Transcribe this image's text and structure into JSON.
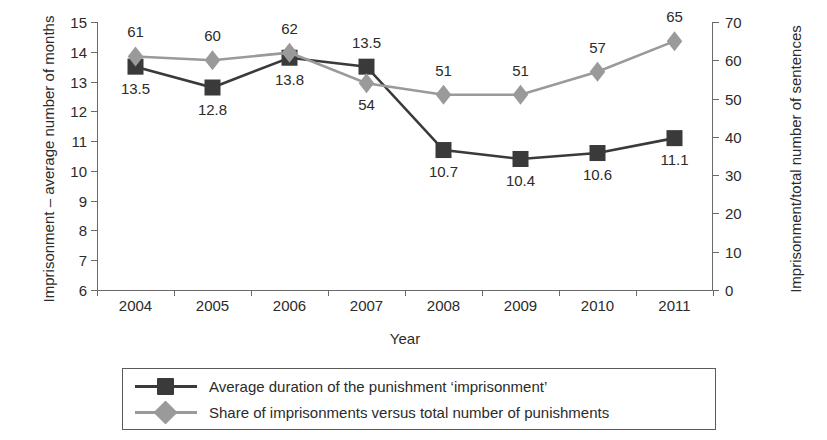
{
  "chart_data": {
    "type": "line",
    "title": "",
    "xlabel": "Year",
    "ylabel": "Imprisonment – average number of months",
    "ylabel_right": "Imprisonment/total number of sentences",
    "categories": [
      "2004",
      "2005",
      "2006",
      "2007",
      "2008",
      "2009",
      "2010",
      "2011"
    ],
    "ylim": [
      6,
      15
    ],
    "ylim_right": [
      0,
      70
    ],
    "ytick_step": 1,
    "ytick_right_step": 10,
    "yticks": [
      "15",
      "14",
      "13",
      "12",
      "11",
      "10",
      "9",
      "8",
      "7",
      "6"
    ],
    "yticks_right": [
      "70",
      "60",
      "50",
      "40",
      "30",
      "20",
      "10",
      "0"
    ],
    "grid": false,
    "legend_position": "bottom",
    "series": [
      {
        "name": "Average duration of the punishment ‘imprisonment’",
        "axis": "left",
        "marker": "square",
        "color": "#3a3a3a",
        "values": [
          13.5,
          12.8,
          13.8,
          13.5,
          10.7,
          10.4,
          10.6,
          11.1
        ],
        "labels": [
          "13.5",
          "12.8",
          "13.8",
          "13.5",
          "10.7",
          "10.4",
          "10.6",
          "11.1"
        ],
        "label_side": [
          "below",
          "below",
          "below",
          "above",
          "below",
          "below",
          "below",
          "below"
        ]
      },
      {
        "name": "Share of imprisonments versus total number of punishments",
        "axis": "right",
        "marker": "diamond",
        "color": "#9a9a9a",
        "values": [
          61,
          60,
          62,
          54,
          51,
          51,
          57,
          65
        ],
        "labels": [
          "61",
          "60",
          "62",
          "54",
          "51",
          "51",
          "57",
          "65"
        ],
        "label_side": [
          "above",
          "above",
          "above",
          "below",
          "above",
          "above",
          "above",
          "above"
        ]
      }
    ]
  },
  "legend": {
    "items": [
      {
        "label": "Average duration of the punishment ‘imprisonment’",
        "color": "#3a3a3a",
        "marker": "square"
      },
      {
        "label": "Share of imprisonments versus total number of punishments",
        "color": "#9a9a9a",
        "marker": "diamond"
      }
    ]
  },
  "colors": {
    "series_dark": "#3a3a3a",
    "series_gray": "#9a9a9a",
    "axis": "#6a6a6a",
    "text": "#2b2b2b",
    "background": "#ffffff"
  }
}
